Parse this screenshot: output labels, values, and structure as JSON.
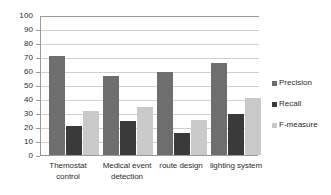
{
  "chart_data": {
    "type": "bar",
    "title": "",
    "subtitle": "",
    "xlabel": "",
    "ylabel": "",
    "ylim": [
      0,
      100
    ],
    "ytick_step": 10,
    "yticks": [
      "100",
      "90",
      "80",
      "70",
      "60",
      "50",
      "40",
      "30",
      "20",
      "10",
      "0"
    ],
    "grid": "horizontal",
    "legend_position": "right",
    "categories": [
      "Themostat control",
      "Medical event detection",
      "route design",
      "lighting system"
    ],
    "category_lines": [
      [
        "Themostat",
        "control"
      ],
      [
        "Medical event",
        "detection"
      ],
      [
        "route design"
      ],
      [
        "lighting system"
      ]
    ],
    "series": [
      {
        "name": "Precision",
        "color": "#6e6e6e",
        "values": [
          71,
          56.5,
          59.5,
          66
        ]
      },
      {
        "name": "Recall",
        "color": "#3a3a3a",
        "values": [
          20.5,
          24.5,
          16,
          29.5
        ]
      },
      {
        "name": "F-measure",
        "color": "#c9c9c9",
        "values": [
          31.5,
          34,
          25,
          41
        ]
      }
    ]
  },
  "legend": {
    "items": [
      {
        "label": "Precision",
        "swatch_name": "legend-swatch-precision"
      },
      {
        "label": "Recall",
        "swatch_name": "legend-swatch-recall"
      },
      {
        "label": "F-measure",
        "swatch_name": "legend-swatch-fmeasure"
      }
    ]
  },
  "axis": {
    "y_ticks": [
      "100",
      "90",
      "80",
      "70",
      "60",
      "50",
      "40",
      "30",
      "20",
      "10",
      "0"
    ]
  }
}
